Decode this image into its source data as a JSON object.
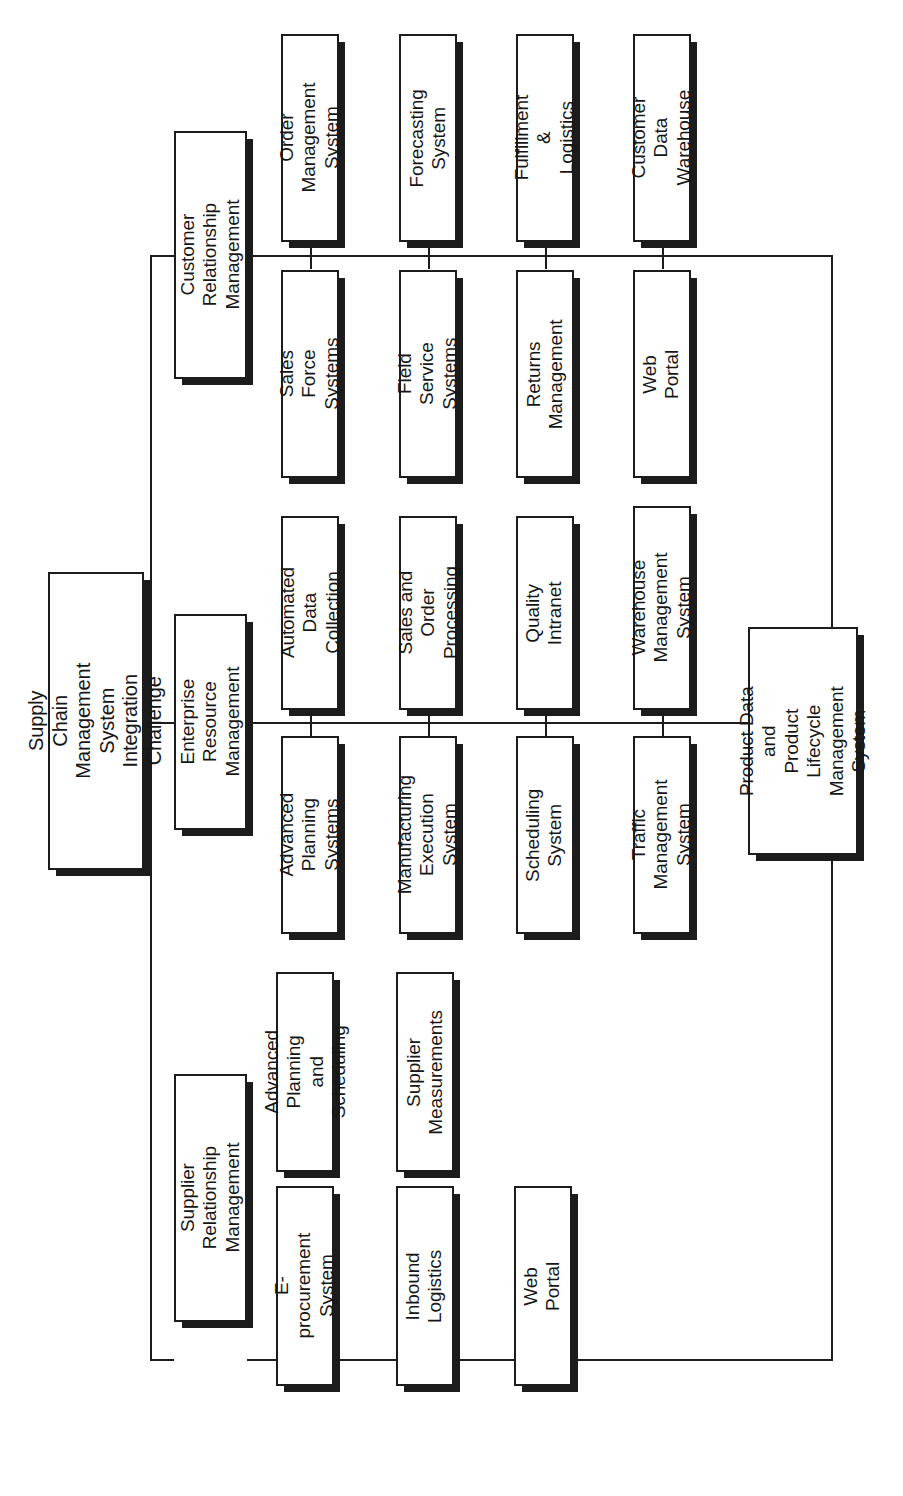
{
  "diagram": {
    "title": "Supply Chain Management System Integration Challenge",
    "orientation": "rotated-90-ccw",
    "root": {
      "id": "root",
      "label": "Supply Chain Management\nSystem Integration Challenge"
    },
    "categories": [
      {
        "id": "crm",
        "label": "Customer Relationship\nManagement",
        "children_row_a": [
          {
            "id": "order-management-system",
            "label": "Order Management\nSystem"
          },
          {
            "id": "forecasting-system",
            "label": "Forecasting\nSystem"
          },
          {
            "id": "fulfillment-logistics",
            "label": "Fulfillment &\nLogistics"
          },
          {
            "id": "customer-data-warehouse",
            "label": "Customer Data\nWarehouse"
          }
        ],
        "children_row_b": [
          {
            "id": "sales-force-systems",
            "label": "Sales Force\nSystems"
          },
          {
            "id": "field-service-systems",
            "label": "Field Service\nSystems"
          },
          {
            "id": "returns-management",
            "label": "Returns\nManagement"
          },
          {
            "id": "web-portal-crm",
            "label": "Web Portal"
          }
        ]
      },
      {
        "id": "erm",
        "label": "Enterprise Resource\nManagement",
        "children_row_a": [
          {
            "id": "automated-data-collection",
            "label": "Automated Data\nCollection"
          },
          {
            "id": "sales-and-order-processing",
            "label": "Sales and Order\nProcessing"
          },
          {
            "id": "quality-intranet",
            "label": "Quality\nIntranet"
          },
          {
            "id": "warehouse-management-system",
            "label": "Warehouse\nManagement System"
          }
        ],
        "children_row_b": [
          {
            "id": "advanced-planning-systems",
            "label": "Advanced Planning\nSystems"
          },
          {
            "id": "manufacturing-execution-system",
            "label": "Manufacturing\nExecution System"
          },
          {
            "id": "scheduling-system",
            "label": "Scheduling\nSystem"
          },
          {
            "id": "traffic-management-system",
            "label": "Traffic Management\nSystem"
          }
        ]
      },
      {
        "id": "srm",
        "label": "Supplier Relationship\nManagement",
        "children_row_a": [
          {
            "id": "advanced-planning-and-scheduling",
            "label": "Advanced Planning\nand Scheduling"
          },
          {
            "id": "supplier-measurements",
            "label": "Supplier\nMeasurements"
          }
        ],
        "children_row_b": [
          {
            "id": "e-procurement-system",
            "label": "E-procurement\nSystem"
          },
          {
            "id": "inbound-logistics",
            "label": "Inbound\nLogistics"
          },
          {
            "id": "web-portal-srm",
            "label": "Web Portal"
          }
        ]
      }
    ],
    "shared_node": {
      "id": "product-data-plm",
      "label": "Product Data and\nProduct Lifecycle\nManagement\nSystem"
    },
    "colors": {
      "stroke": "#1c1c1c",
      "fill": "#ffffff",
      "shadow": "#1c1c1c",
      "text": "#161616"
    }
  }
}
